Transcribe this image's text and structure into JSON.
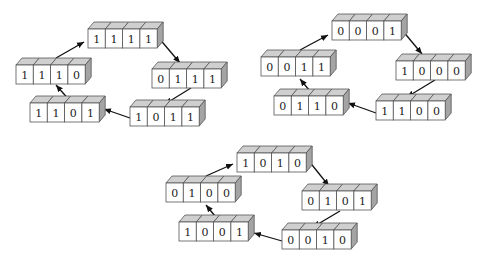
{
  "diagram": {
    "type": "state-cycle",
    "colors": {
      "front": "#ffffff",
      "top": "#cfcfcf",
      "side": "#a4a4a4",
      "stroke": "#555555",
      "arrow": "#111111"
    },
    "box": {
      "cell_w": 17.3,
      "h": 19,
      "dx": 6,
      "dy": 7
    },
    "cycles": [
      {
        "name": "cycle-1",
        "states": [
          {
            "bits": [
              "1",
              "1",
              "1",
              "1"
            ],
            "x": 88,
            "y": 29
          },
          {
            "bits": [
              "0",
              "1",
              "1",
              "1"
            ],
            "x": 152,
            "y": 69
          },
          {
            "bits": [
              "1",
              "0",
              "1",
              "1"
            ],
            "x": 130,
            "y": 107
          },
          {
            "bits": [
              "1",
              "1",
              "0",
              "1"
            ],
            "x": 30,
            "y": 103
          },
          {
            "bits": [
              "1",
              "1",
              "1",
              "0"
            ],
            "x": 16,
            "y": 65
          }
        ],
        "arrows": [
          {
            "from": [
              158,
              37
            ],
            "to": [
              180,
              63
            ]
          },
          {
            "from": [
              191,
              88
            ],
            "to": [
              165,
              104
            ]
          },
          {
            "from": [
              130,
              118
            ],
            "to": [
              104,
              109
            ]
          },
          {
            "from": [
              71,
              102
            ],
            "to": [
              56,
              85
            ]
          },
          {
            "from": [
              56,
              58
            ],
            "to": [
              84,
              42
            ]
          }
        ]
      },
      {
        "name": "cycle-2",
        "states": [
          {
            "bits": [
              "0",
              "0",
              "0",
              "1"
            ],
            "x": 332,
            "y": 21
          },
          {
            "bits": [
              "1",
              "0",
              "0",
              "0"
            ],
            "x": 396,
            "y": 61
          },
          {
            "bits": [
              "1",
              "1",
              "0",
              "0"
            ],
            "x": 376,
            "y": 101
          },
          {
            "bits": [
              "0",
              "1",
              "1",
              "0"
            ],
            "x": 274,
            "y": 96
          },
          {
            "bits": [
              "0",
              "0",
              "1",
              "1"
            ],
            "x": 261,
            "y": 57
          }
        ],
        "arrows": [
          {
            "from": [
              402,
              30
            ],
            "to": [
              422,
              54
            ]
          },
          {
            "from": [
              435,
              80
            ],
            "to": [
              407,
              97
            ]
          },
          {
            "from": [
              376,
              113
            ],
            "to": [
              348,
              103
            ]
          },
          {
            "from": [
              314,
              96
            ],
            "to": [
              300,
              79
            ]
          },
          {
            "from": [
              300,
              50
            ],
            "to": [
              328,
              35
            ]
          }
        ]
      },
      {
        "name": "cycle-3",
        "states": [
          {
            "bits": [
              "1",
              "0",
              "1",
              "0"
            ],
            "x": 237,
            "y": 153
          },
          {
            "bits": [
              "0",
              "1",
              "0",
              "1"
            ],
            "x": 302,
            "y": 191
          },
          {
            "bits": [
              "0",
              "0",
              "1",
              "0"
            ],
            "x": 282,
            "y": 230
          },
          {
            "bits": [
              "1",
              "0",
              "0",
              "1"
            ],
            "x": 179,
            "y": 222
          },
          {
            "bits": [
              "0",
              "1",
              "0",
              "0"
            ],
            "x": 166,
            "y": 183
          }
        ],
        "arrows": [
          {
            "from": [
              308,
              160
            ],
            "to": [
              329,
              186
            ]
          },
          {
            "from": [
              340,
              211
            ],
            "to": [
              313,
              227
            ]
          },
          {
            "from": [
              282,
              241
            ],
            "to": [
              254,
              233
            ]
          },
          {
            "from": [
              219,
              221
            ],
            "to": [
              206,
              205
            ]
          },
          {
            "from": [
              206,
              176
            ],
            "to": [
              233,
              164
            ]
          }
        ]
      }
    ]
  }
}
